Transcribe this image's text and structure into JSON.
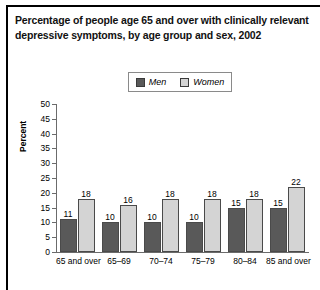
{
  "figure": {
    "title": "Percentage of people age 65 and over with clinically relevant depressive symptoms, by age group and sex, 2002"
  },
  "chart_data": {
    "type": "bar",
    "title": "Percentage of people age 65 and over with clinically relevant depressive symptoms, by age group and sex, 2002",
    "xlabel": "",
    "ylabel": "Percent",
    "ylim": [
      0,
      50
    ],
    "ytick_step": 5,
    "yticks": [
      "50",
      "45",
      "40",
      "35",
      "30",
      "25",
      "20",
      "15",
      "10",
      "5",
      "0"
    ],
    "grid": false,
    "legend_position": "top-center",
    "categories": [
      "65 and over",
      "65–69",
      "70–74",
      "75–79",
      "80–84",
      "85 and over"
    ],
    "series": [
      {
        "name": "Men",
        "color": "#595959",
        "values": [
          11,
          10,
          10,
          10,
          15,
          15
        ]
      },
      {
        "name": "Women",
        "color": "#d4d4d4",
        "values": [
          18,
          16,
          18,
          18,
          18,
          22
        ]
      }
    ]
  }
}
